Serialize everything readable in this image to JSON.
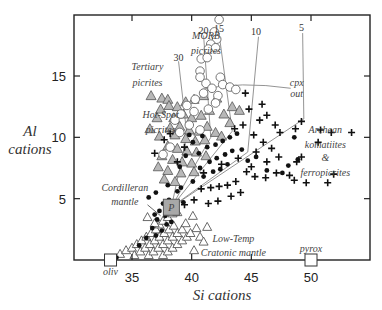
{
  "chart_data": {
    "type": "scatter",
    "title": "",
    "xlabel": "Si cations",
    "ylabel": "Al cations",
    "ylabel_lines": [
      "Al",
      "cations"
    ],
    "xlim": [
      30.5,
      54.5
    ],
    "ylim": [
      0,
      19.8
    ],
    "x_ticks": [
      35,
      40,
      45,
      50
    ],
    "y_ticks": [
      5,
      10,
      15
    ],
    "grid": false,
    "legend": "none (inline annotations)",
    "colors": {
      "frame": "#222222",
      "triangle_fill": "#b8b8b8",
      "triangle_stroke": "#555555",
      "circle_fill": "#ffffff",
      "circle_stroke": "#666666",
      "cross": "#111111",
      "dot": "#111111",
      "guide_line": "#888888",
      "p_box_fill": "#a8a8a8"
    },
    "annotations": [
      {
        "text": "MORB",
        "x": 41.2,
        "y": 18.3
      },
      {
        "text": "picrites",
        "x": 41.2,
        "y": 17.0
      },
      {
        "text": "Tertiary",
        "x": 36.3,
        "y": 15.7
      },
      {
        "text": "picrites",
        "x": 36.3,
        "y": 14.4
      },
      {
        "text": "Hot-Spot",
        "x": 37.4,
        "y": 11.8
      },
      {
        "text": "picrites",
        "x": 37.4,
        "y": 10.6
      },
      {
        "text": "Cordilleran",
        "x": 34.4,
        "y": 5.9
      },
      {
        "text": "mantle",
        "x": 34.4,
        "y": 4.7
      },
      {
        "text": "Low-Temp",
        "x": 43.5,
        "y": 1.7
      },
      {
        "text": "Cratonic mantle",
        "x": 43.5,
        "y": 0.6
      },
      {
        "text": "Archean",
        "x": 51.2,
        "y": 10.6
      },
      {
        "text": "komatiites",
        "x": 51.2,
        "y": 9.4
      },
      {
        "text": "&",
        "x": 51.2,
        "y": 8.3
      },
      {
        "text": "ferropicrites",
        "x": 51.2,
        "y": 7.1
      },
      {
        "text": "cpx",
        "x": 48.8,
        "y": 14.4
      },
      {
        "text": "out",
        "x": 48.8,
        "y": 13.5
      },
      {
        "text": "oliv",
        "x": 33.2,
        "y": -1.0
      },
      {
        "text": "pyrox",
        "x": 50.0,
        "y": 0.9
      },
      {
        "text": "P",
        "x": 38.3,
        "y": 4.3
      }
    ],
    "melt_fraction_labels": [
      {
        "text": "30",
        "x": 38.9,
        "y": 16.5
      },
      {
        "text": "20",
        "x": 41.0,
        "y": 18.7
      },
      {
        "text": "15",
        "x": 42.3,
        "y": 18.8
      },
      {
        "text": "10",
        "x": 45.4,
        "y": 18.6
      },
      {
        "text": "5",
        "x": 49.2,
        "y": 18.9
      }
    ],
    "end_members": [
      {
        "name": "oliv",
        "x": 33.2,
        "y": 0
      },
      {
        "name": "pyrox",
        "x": 50.0,
        "y": 0
      },
      {
        "name": "P",
        "x": 38.3,
        "y": 4.3
      }
    ],
    "series": [
      {
        "name": "MORB picrites",
        "marker": "open-circle",
        "points": [
          [
            42.3,
            19.6
          ],
          [
            41.9,
            18.6
          ],
          [
            42.1,
            18.0
          ],
          [
            41.6,
            17.6
          ],
          [
            41.4,
            17.2
          ],
          [
            42.0,
            17.3
          ],
          [
            40.8,
            16.4
          ],
          [
            41.3,
            16.5
          ],
          [
            40.7,
            15.4
          ],
          [
            40.7,
            14.9
          ],
          [
            41.2,
            14.4
          ],
          [
            42.4,
            14.9
          ],
          [
            41.7,
            14.0
          ],
          [
            42.6,
            14.3
          ],
          [
            43.2,
            14.1
          ],
          [
            43.7,
            13.9
          ],
          [
            42.2,
            13.4
          ],
          [
            41.0,
            13.6
          ],
          [
            40.3,
            13.1
          ],
          [
            39.6,
            12.6
          ],
          [
            39.1,
            11.9
          ],
          [
            38.6,
            11.4
          ],
          [
            40.2,
            12.1
          ],
          [
            41.4,
            12.3
          ],
          [
            39.0,
            10.4
          ],
          [
            38.2,
            9.2
          ],
          [
            37.6,
            8.6
          ],
          [
            40.7,
            10.6
          ],
          [
            42.0,
            12.8
          ],
          [
            39.8,
            11.0
          ]
        ]
      },
      {
        "name": "Tertiary / Hot-Spot picrites",
        "marker": "filled-triangle-gray",
        "points": [
          [
            36.6,
            13.4
          ],
          [
            37.5,
            13.2
          ],
          [
            38.0,
            13.1
          ],
          [
            37.4,
            12.3
          ],
          [
            36.5,
            10.7
          ],
          [
            37.1,
            11.6
          ],
          [
            38.1,
            12.6
          ],
          [
            38.8,
            12.5
          ],
          [
            39.5,
            12.9
          ],
          [
            40.2,
            13.1
          ],
          [
            41.0,
            13.4
          ],
          [
            42.1,
            13.2
          ],
          [
            43.4,
            12.5
          ],
          [
            44.0,
            12.2
          ],
          [
            38.5,
            11.6
          ],
          [
            39.3,
            11.9
          ],
          [
            40.0,
            11.6
          ],
          [
            40.8,
            11.8
          ],
          [
            41.5,
            12.2
          ],
          [
            42.7,
            11.9
          ],
          [
            43.2,
            11.2
          ],
          [
            38.2,
            10.8
          ],
          [
            39.0,
            10.9
          ],
          [
            39.8,
            10.6
          ],
          [
            40.6,
            10.5
          ],
          [
            41.3,
            10.9
          ],
          [
            42.0,
            10.4
          ],
          [
            37.3,
            10.1
          ],
          [
            38.6,
            10.2
          ],
          [
            39.5,
            9.9
          ],
          [
            40.3,
            9.7
          ],
          [
            41.1,
            9.8
          ],
          [
            42.5,
            10.1
          ],
          [
            38.0,
            9.3
          ],
          [
            38.8,
            9.1
          ],
          [
            39.6,
            8.9
          ],
          [
            40.4,
            8.8
          ],
          [
            41.2,
            8.5
          ],
          [
            37.5,
            8.5
          ],
          [
            38.4,
            8.2
          ],
          [
            39.2,
            8.0
          ],
          [
            40.0,
            7.9
          ],
          [
            37.2,
            7.6
          ],
          [
            38.0,
            7.3
          ],
          [
            39.1,
            7.1
          ],
          [
            40.2,
            7.2
          ],
          [
            37.7,
            6.6
          ],
          [
            38.6,
            6.4
          ]
        ]
      },
      {
        "name": "Low-Temp Cratonic mantle",
        "marker": "open-triangle",
        "points": [
          [
            34.0,
            0.5
          ],
          [
            34.5,
            0.8
          ],
          [
            35.0,
            1.0
          ],
          [
            35.4,
            1.3
          ],
          [
            35.8,
            1.6
          ],
          [
            36.2,
            1.9
          ],
          [
            36.6,
            2.2
          ],
          [
            37.0,
            2.5
          ],
          [
            37.3,
            2.9
          ],
          [
            37.6,
            3.2
          ],
          [
            38.0,
            3.5
          ],
          [
            38.4,
            3.8
          ],
          [
            35.2,
            0.4
          ],
          [
            35.7,
            0.7
          ],
          [
            36.1,
            1.0
          ],
          [
            36.5,
            1.3
          ],
          [
            36.9,
            1.6
          ],
          [
            37.3,
            1.9
          ],
          [
            37.7,
            2.2
          ],
          [
            38.1,
            2.5
          ],
          [
            38.5,
            2.8
          ],
          [
            36.4,
            0.4
          ],
          [
            36.8,
            0.7
          ],
          [
            37.2,
            1.0
          ],
          [
            37.6,
            1.3
          ],
          [
            38.0,
            1.6
          ],
          [
            38.4,
            1.9
          ],
          [
            38.8,
            2.2
          ],
          [
            39.2,
            2.5
          ],
          [
            37.6,
            0.4
          ],
          [
            38.0,
            0.7
          ],
          [
            38.4,
            1.0
          ],
          [
            38.8,
            1.3
          ],
          [
            39.2,
            1.6
          ],
          [
            39.6,
            1.9
          ],
          [
            36.3,
            3.5
          ],
          [
            36.9,
            3.0
          ],
          [
            38.8,
            3.9
          ],
          [
            39.5,
            3.0
          ],
          [
            40.1,
            3.6
          ],
          [
            40.4,
            2.6
          ],
          [
            41.3,
            2.7
          ],
          [
            40.7,
            1.9
          ],
          [
            41.0,
            1.5
          ],
          [
            39.9,
            2.2
          ],
          [
            40.2,
            0.8
          ]
        ]
      },
      {
        "name": "Cordilleran mantle",
        "marker": "filled-dot",
        "points": [
          [
            33.7,
            0.2
          ],
          [
            35.6,
            1.2
          ],
          [
            36.2,
            1.8
          ],
          [
            36.7,
            2.6
          ],
          [
            37.1,
            3.3
          ],
          [
            37.3,
            4.0
          ],
          [
            37.8,
            3.6
          ],
          [
            37.6,
            4.6
          ],
          [
            38.1,
            4.9
          ],
          [
            37.0,
            2.0
          ],
          [
            37.5,
            2.4
          ],
          [
            37.9,
            2.9
          ],
          [
            38.3,
            3.1
          ],
          [
            36.9,
            3.7
          ],
          [
            38.6,
            4.5
          ],
          [
            36.4,
            5.1
          ],
          [
            37.0,
            5.5
          ],
          [
            38.0,
            6.1
          ],
          [
            38.8,
            5.6
          ],
          [
            39.3,
            4.7
          ],
          [
            39.1,
            5.9
          ],
          [
            40.1,
            6.4
          ],
          [
            41.0,
            6.8
          ],
          [
            41.8,
            7.2
          ],
          [
            42.4,
            7.4
          ],
          [
            43.0,
            7.8
          ],
          [
            40.7,
            7.5
          ],
          [
            41.5,
            8.0
          ],
          [
            42.1,
            8.3
          ],
          [
            42.8,
            8.6
          ],
          [
            43.4,
            8.9
          ],
          [
            44.2,
            9.0
          ],
          [
            41.3,
            9.2
          ],
          [
            42.0,
            9.4
          ],
          [
            42.6,
            9.7
          ],
          [
            43.2,
            10.0
          ],
          [
            43.8,
            10.3
          ],
          [
            40.6,
            8.7
          ],
          [
            39.5,
            8.5
          ],
          [
            39.0,
            7.6
          ],
          [
            40.1,
            9.6
          ],
          [
            44.7,
            8.1
          ],
          [
            45.4,
            8.4
          ],
          [
            46.3,
            7.3
          ],
          [
            47.6,
            7.1
          ],
          [
            48.1,
            7.7
          ],
          [
            48.9,
            8.2
          ],
          [
            48.6,
            10.0
          ],
          [
            39.8,
            10.2
          ],
          [
            40.9,
            10.1
          ]
        ]
      },
      {
        "name": "Archean komatiites & ferropicrites",
        "marker": "plus-cross",
        "points": [
          [
            44.5,
            13.6
          ],
          [
            45.9,
            12.7
          ],
          [
            44.8,
            12.3
          ],
          [
            45.7,
            11.4
          ],
          [
            46.3,
            11.8
          ],
          [
            47.4,
            10.4
          ],
          [
            47.0,
            11.0
          ],
          [
            48.7,
            10.7
          ],
          [
            49.2,
            11.3
          ],
          [
            50.8,
            10.6
          ],
          [
            51.7,
            10.4
          ],
          [
            53.4,
            10.4
          ],
          [
            50.6,
            9.6
          ],
          [
            49.2,
            8.4
          ],
          [
            48.8,
            8.0
          ],
          [
            51.9,
            7.0
          ],
          [
            51.4,
            6.3
          ],
          [
            44.3,
            11.0
          ],
          [
            43.6,
            10.7
          ],
          [
            45.2,
            10.2
          ],
          [
            46.0,
            9.6
          ],
          [
            46.7,
            9.1
          ],
          [
            45.4,
            8.8
          ],
          [
            44.6,
            7.2
          ],
          [
            45.3,
            6.8
          ],
          [
            46.2,
            6.7
          ],
          [
            47.1,
            7.1
          ],
          [
            48.2,
            6.9
          ],
          [
            48.6,
            6.5
          ],
          [
            49.6,
            6.3
          ],
          [
            43.7,
            6.4
          ],
          [
            43.0,
            6.1
          ],
          [
            42.3,
            6.0
          ],
          [
            41.6,
            5.9
          ],
          [
            40.8,
            5.8
          ],
          [
            40.2,
            4.9
          ],
          [
            39.4,
            4.5
          ],
          [
            41.4,
            4.6
          ],
          [
            42.2,
            4.8
          ],
          [
            43.3,
            5.2
          ],
          [
            44.1,
            5.5
          ],
          [
            41.0,
            7.1
          ],
          [
            42.5,
            7.8
          ],
          [
            43.9,
            8.3
          ],
          [
            45.0,
            7.6
          ],
          [
            46.3,
            8.0
          ],
          [
            47.3,
            8.4
          ],
          [
            38.8,
            8.0
          ],
          [
            39.4,
            9.2
          ],
          [
            38.2,
            10.3
          ],
          [
            37.7,
            9.8
          ],
          [
            36.9,
            8.7
          ]
        ]
      }
    ]
  }
}
